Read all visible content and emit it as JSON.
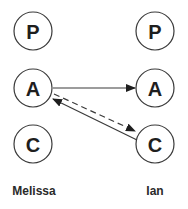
{
  "diagram": {
    "type": "transactional-analysis-ego-states",
    "people": [
      {
        "name": "Melissa",
        "states": [
          {
            "letter": "P",
            "meaning": "Parent"
          },
          {
            "letter": "A",
            "meaning": "Adult"
          },
          {
            "letter": "C",
            "meaning": "Child"
          }
        ]
      },
      {
        "name": "Ian",
        "states": [
          {
            "letter": "P",
            "meaning": "Parent"
          },
          {
            "letter": "A",
            "meaning": "Adult"
          },
          {
            "letter": "C",
            "meaning": "Child"
          }
        ]
      }
    ],
    "left": {
      "label": "Melissa",
      "p": "P",
      "a": "A",
      "c": "C"
    },
    "right": {
      "label": "Ian",
      "p": "P",
      "a": "A",
      "c": "C"
    },
    "transactions": [
      {
        "from": "Melissa.A",
        "to": "Ian.A",
        "style": "solid"
      },
      {
        "from": "Melissa.A",
        "to": "Ian.C",
        "style": "dashed"
      },
      {
        "from": "Ian.C",
        "to": "Melissa.A",
        "style": "solid"
      }
    ],
    "colors": {
      "stroke": "#3a3a3a",
      "text": "#1e1e1e",
      "background": "#ffffff"
    }
  }
}
